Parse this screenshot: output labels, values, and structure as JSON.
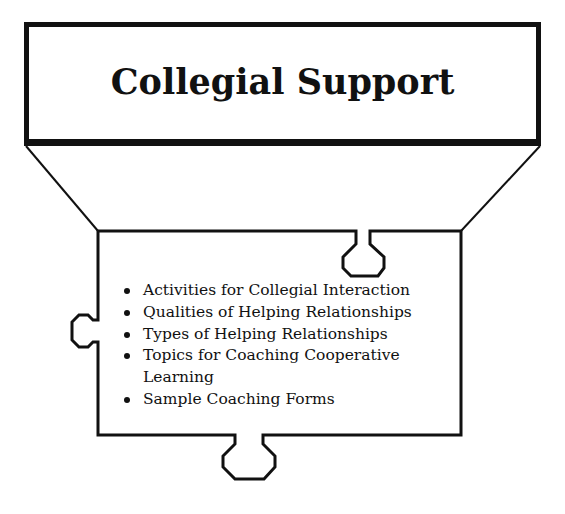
{
  "title": "Collegial Support",
  "items": [
    {
      "label": "Activities for Collegial Interaction"
    },
    {
      "label": "Qualities of Helping Relationships"
    },
    {
      "label": "Types of Helping Relationships"
    },
    {
      "label": "Topics for Coaching Cooperative Learning"
    },
    {
      "label": "Sample Coaching Forms"
    }
  ],
  "colors": {
    "stroke": "#111111",
    "background": "#ffffff"
  },
  "shapes": {
    "title_box": "rectangle",
    "connector": "funnel-diagonals",
    "content_shape": "puzzle-piece"
  }
}
